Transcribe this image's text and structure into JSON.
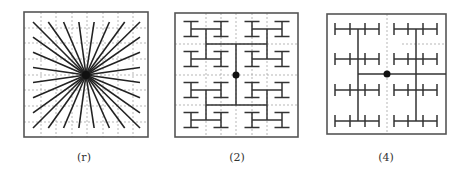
{
  "figure": {
    "panels": [
      {
        "id": "r",
        "caption": "(r)",
        "caption_center_x": 84,
        "type": "starburst",
        "frame": {
          "x": 24,
          "y": 12,
          "w": 124,
          "h": 125
        },
        "grid": {
          "xs": [
            41,
            56,
            72,
            87,
            103,
            118,
            133
          ],
          "ys": [
            28,
            43,
            59,
            75,
            90,
            106,
            122
          ]
        },
        "center": {
          "x": 86,
          "y": 75
        },
        "ray_bounds": {
          "x0": 33,
          "y0": 22,
          "x1": 140,
          "y1": 128,
          "steps": 7
        }
      },
      {
        "id": "2",
        "caption": "(2)",
        "caption_center_x": 237,
        "type": "h-tree",
        "frame": {
          "x": 175,
          "y": 13,
          "w": 123,
          "h": 124
        },
        "grid": {
          "xs": [
            206,
            221,
            236,
            252,
            267
          ],
          "ys": [
            44,
            75,
            105
          ]
        },
        "center": {
          "x": 236,
          "y": 75
        },
        "leaf_columns": [
          191,
          221,
          252,
          282
        ],
        "leaf_rows_mid": [
          29,
          59,
          90,
          120
        ],
        "leaf_half_width": 7.5,
        "leaf_half_height": 7.5
      },
      {
        "id": "4",
        "caption": "(4)",
        "caption_center_x": 386,
        "type": "comb-tree",
        "frame": {
          "x": 327,
          "y": 14,
          "w": 119,
          "h": 120
        },
        "grid": {
          "xs": [
            387
          ],
          "ys": [],
          "extra": [
            {
              "x1": 402,
              "y1": 44,
              "x2": 446,
              "y2": 44
            }
          ]
        },
        "center": {
          "x": 387,
          "y": 74
        },
        "halves": [
          {
            "trunk_x": 358,
            "ticks": [
              335,
              350,
              365,
              379
            ]
          },
          {
            "trunk_x": 416,
            "ticks": [
              394,
              408,
              423,
              437
            ]
          }
        ],
        "comb_rows": [
          29,
          59,
          90,
          121
        ],
        "tick_half_height": 6
      }
    ],
    "colors": {
      "stroke": "#333333",
      "frame": "#555555",
      "grid": "#9a9a9a",
      "dot": "#111111"
    }
  }
}
